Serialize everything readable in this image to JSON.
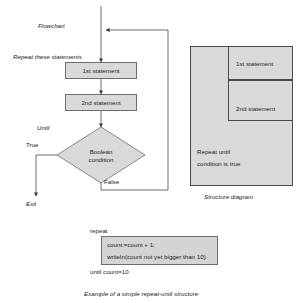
{
  "figure": {
    "caption": "Example of a simple repeat-until structure"
  },
  "flowchart": {
    "title": "Flowchart",
    "entry_label": "Repeat these statements",
    "until_label": "Until",
    "true_label": "True",
    "false_label": "False",
    "exit_label": "Exit",
    "statement_1": "1st statement",
    "statement_2": "2nd statement",
    "decision_line_1": "Boolean",
    "decision_line_2": "condition"
  },
  "structure_diagram": {
    "caption": "Structure diagram",
    "statement_1": "1st statement",
    "statement_2": "2nd statement",
    "loop_line_1": "Repeat until",
    "loop_line_2": "condition is true"
  },
  "code": {
    "keyword_repeat": "repeat",
    "line_1": "count:=count + 1;",
    "line_2": "writeln(count not yet bigger than 10)",
    "keyword_until": "until count=10"
  },
  "colors": {
    "box_fill": "#d9d9d9",
    "box_stroke": "#6e6e6e",
    "line": "#4a4a4a",
    "text": "#1b1b1b"
  }
}
